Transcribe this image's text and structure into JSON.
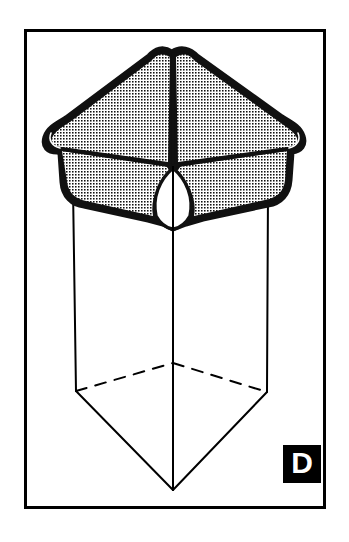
{
  "figure": {
    "kind": "spatial-reasoning-figure",
    "canvas": {
      "width": 349,
      "height": 542,
      "background": "#ffffff"
    },
    "frame": {
      "name": "outer-border",
      "x": 24,
      "y": 29,
      "width": 301,
      "height": 479,
      "stroke": "#000000",
      "stroke_width": 3,
      "fill": "#ffffff"
    },
    "colors": {
      "ink": "#000000",
      "paper": "#ffffff",
      "stipple_dot": "#1a1a1a",
      "label_box": "#000000",
      "label_text": "#ffffff"
    },
    "folded_cap": {
      "name": "folded-sheet-cap",
      "fill": "stipple-halftone",
      "outline_width": 4,
      "fold_line_width": 3,
      "peaks": 2,
      "notch_center_x": 173
    },
    "prism": {
      "name": "wireframe-prism",
      "stroke_width": 2,
      "hidden_edge_style": "dashed",
      "hidden_dash_pattern": "11 9",
      "top_y": 186,
      "bottom_vertex": {
        "x": 173,
        "y": 490
      },
      "left_edge_x": 74,
      "right_edge_x": 268,
      "center_edge_x": 173
    },
    "answer_label": {
      "name": "answer-label-d",
      "letter": "D",
      "box": {
        "x": 283,
        "y": 445,
        "width": 38,
        "height": 38
      }
    }
  }
}
